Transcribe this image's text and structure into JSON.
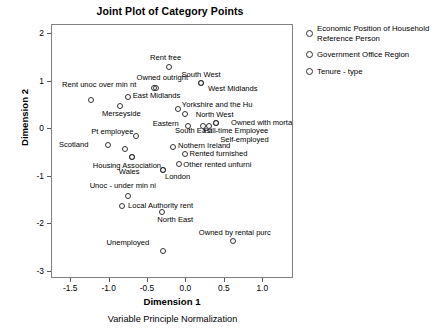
{
  "chart_data": {
    "type": "scatter",
    "title": "Joint Plot of Category Points",
    "xlabel": "Dimension 1",
    "ylabel": "Dimension 2",
    "footnote": "Variable Principle Normalization",
    "xlim": [
      -1.75,
      1.4
    ],
    "ylim": [
      -3.15,
      2.2
    ],
    "xticks": [
      -1.5,
      -1.0,
      -0.5,
      0.0,
      0.5,
      1.0
    ],
    "xtick_labels": [
      "-1.5",
      "-1.0",
      "-0.5",
      "0.0",
      "0.5",
      "1.0"
    ],
    "yticks": [
      2,
      1,
      0,
      -1,
      -2,
      -3
    ],
    "ytick_labels": [
      "2",
      "1",
      "0",
      "-1",
      "-2",
      "-3"
    ],
    "grid": false,
    "legend_position": "right",
    "marker": "open-circle",
    "legend": [
      {
        "label": "Economic Position of Household Reference Person",
        "marker": "open-circle"
      },
      {
        "label": "Government Office Region",
        "marker": "open-circle"
      },
      {
        "label": "Tenure - type",
        "marker": "open-circle"
      }
    ],
    "points": [
      {
        "label": "Rent free",
        "x": -0.23,
        "y": 1.31,
        "lx": -0.27,
        "ly": 1.5,
        "align": "center"
      },
      {
        "label": "South West",
        "x": 0.19,
        "y": 0.97,
        "lx": 0.19,
        "ly": 1.15,
        "align": "center"
      },
      {
        "label": "Owned outright",
        "x": -0.4,
        "y": 0.88,
        "lx": -0.65,
        "ly": 1.08,
        "align": "left"
      },
      {
        "label": "West Midlands",
        "x": 0.19,
        "y": 0.97,
        "lx": 0.28,
        "ly": 0.86,
        "align": "left"
      },
      {
        "label": "Rent unoc over min nt",
        "x": -0.42,
        "y": 0.88,
        "lx": -1.62,
        "ly": 0.93,
        "align": "left"
      },
      {
        "label": "East Midlands",
        "x": -0.76,
        "y": 0.69,
        "lx": -0.7,
        "ly": 0.71,
        "align": "left"
      },
      {
        "label": "",
        "x": -1.24,
        "y": 0.62,
        "lx": -1.24,
        "ly": 0.62,
        "align": "hidden"
      },
      {
        "label": "Yorkshire and the Hu",
        "x": -0.11,
        "y": 0.44,
        "lx": -0.06,
        "ly": 0.52,
        "align": "left"
      },
      {
        "label": "Merseyside",
        "x": -0.86,
        "y": 0.5,
        "lx": -1.1,
        "ly": 0.33,
        "align": "left"
      },
      {
        "label": "North West",
        "x": -0.02,
        "y": 0.32,
        "lx": 0.12,
        "ly": 0.31,
        "align": "left"
      },
      {
        "label": "Eastern",
        "x": 0.02,
        "y": 0.08,
        "lx": -0.44,
        "ly": 0.11,
        "align": "left"
      },
      {
        "label": "Owned with mortage",
        "x": 0.38,
        "y": 0.13,
        "lx": 0.58,
        "ly": 0.13,
        "align": "left"
      },
      {
        "label": "Full-time Employee",
        "x": 0.3,
        "y": 0.07,
        "lx": 0.22,
        "ly": -0.04,
        "align": "left"
      },
      {
        "label": "South East",
        "x": 0.22,
        "y": 0.07,
        "lx": -0.15,
        "ly": -0.04,
        "align": "left"
      },
      {
        "label": "Pt employee",
        "x": -0.66,
        "y": -0.14,
        "lx": -1.24,
        "ly": -0.06,
        "align": "left"
      },
      {
        "label": "Self-employed",
        "x": 0.38,
        "y": 0.13,
        "lx": 0.44,
        "ly": -0.22,
        "align": "left"
      },
      {
        "label": "Scotland",
        "x": -1.02,
        "y": -0.33,
        "lx": -1.66,
        "ly": -0.32,
        "align": "left"
      },
      {
        "label": "Nothern Ireland",
        "x": -0.17,
        "y": -0.36,
        "lx": -0.11,
        "ly": -0.35,
        "align": "left"
      },
      {
        "label": "",
        "x": -0.8,
        "y": -0.41,
        "lx": -0.8,
        "ly": -0.41,
        "align": "hidden"
      },
      {
        "label": "Rented furnished",
        "x": -0.02,
        "y": -0.51,
        "lx": 0.04,
        "ly": -0.52,
        "align": "left"
      },
      {
        "label": "",
        "x": -0.71,
        "y": -0.58,
        "lx": -0.71,
        "ly": -0.58,
        "align": "hidden"
      },
      {
        "label": "Housing Association",
        "x": -0.71,
        "y": -0.58,
        "lx": -1.22,
        "ly": -0.76,
        "align": "left"
      },
      {
        "label": "Other rented unfurni",
        "x": -0.1,
        "y": -0.73,
        "lx": -0.04,
        "ly": -0.74,
        "align": "left"
      },
      {
        "label": "Wales",
        "x": -0.3,
        "y": -0.85,
        "lx": -0.88,
        "ly": -0.89,
        "align": "left"
      },
      {
        "label": "London",
        "x": -0.3,
        "y": -0.85,
        "lx": -0.28,
        "ly": -1.0,
        "align": "left"
      },
      {
        "label": "Unoc - under min ni",
        "x": -0.76,
        "y": -1.4,
        "lx": -1.26,
        "ly": -1.2,
        "align": "left"
      },
      {
        "label": "Local Authority rent",
        "x": -0.84,
        "y": -1.62,
        "lx": -0.76,
        "ly": -1.61,
        "align": "left"
      },
      {
        "label": "North East",
        "x": -0.32,
        "y": -1.74,
        "lx": -0.38,
        "ly": -1.91,
        "align": "left"
      },
      {
        "label": "Owned by rental purc",
        "x": 0.6,
        "y": -2.36,
        "lx": 0.16,
        "ly": -2.18,
        "align": "left"
      },
      {
        "label": "Unemployed",
        "x": -0.3,
        "y": -2.55,
        "lx": -1.04,
        "ly": -2.39,
        "align": "left"
      }
    ]
  }
}
